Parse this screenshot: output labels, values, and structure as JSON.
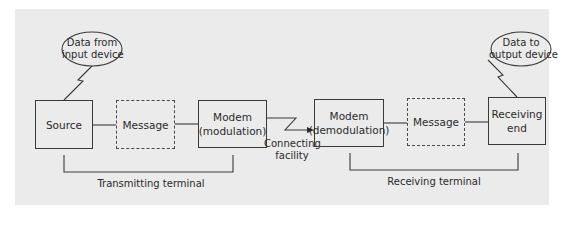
{
  "diagram": {
    "title": "",
    "colors": {
      "panel_background": "#ebebeb",
      "line": "#3a3a3a",
      "text": "#2a2a2a"
    },
    "input_bubble": {
      "line1": "Data from",
      "line2": "input device"
    },
    "output_bubble": {
      "line1": "Data to",
      "line2": "output device"
    },
    "blocks": [
      {
        "id": "source",
        "line1": "Source",
        "line2": "",
        "style": "solid"
      },
      {
        "id": "message-tx",
        "line1": "Message",
        "line2": "",
        "style": "dashed"
      },
      {
        "id": "modem-mod",
        "line1": "Modem",
        "line2": "(modulation)",
        "style": "solid"
      },
      {
        "id": "modem-demod",
        "line1": "Modem",
        "line2": "(demodulation)",
        "style": "solid"
      },
      {
        "id": "message-rx",
        "line1": "Message",
        "line2": "",
        "style": "dashed"
      },
      {
        "id": "receiving-end",
        "line1": "Receiving",
        "line2": "end",
        "style": "solid"
      }
    ],
    "connecting_facility": {
      "line1": "Connecting",
      "line2": "facility"
    },
    "groups": {
      "transmitting": "Transmitting terminal",
      "receiving": "Receiving terminal"
    }
  }
}
